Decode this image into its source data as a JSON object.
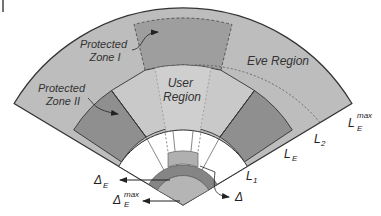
{
  "diagram": {
    "colors": {
      "eve_region": "#bdbdbd",
      "user_region": "#c9c9c9",
      "protected_zone": "#8f8f8f",
      "protected_zone_light": "#a6a6a6",
      "inner_white": "#ffffff",
      "outline": "#333333",
      "text": "#333333"
    },
    "labels": {
      "protected_zone_1": [
        "Protected",
        "Zone I"
      ],
      "protected_zone_2": [
        "Protected",
        "Zone II"
      ],
      "user_region": [
        "User",
        "Region"
      ],
      "eve_region": "Eve Region"
    },
    "boundaries": {
      "l_e_max": {
        "base": "L",
        "sub": "E",
        "sup": "max"
      },
      "l2": {
        "base": "L",
        "sub": "2"
      },
      "l_e": {
        "base": "L",
        "sub": "E"
      },
      "l1": {
        "base": "L",
        "sub": "1"
      }
    },
    "deltas": {
      "delta_e": {
        "base": "Δ",
        "sub": "E"
      },
      "delta_e_max": {
        "base": "Δ",
        "sub": "E",
        "sup": "max"
      },
      "delta": {
        "base": "Δ"
      }
    }
  }
}
